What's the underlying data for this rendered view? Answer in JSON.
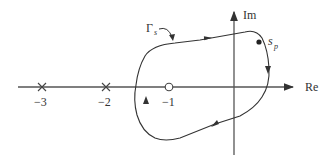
{
  "diagram": {
    "axes": {
      "real_label": "Re",
      "imag_label": "Im"
    },
    "contour_label": "Γ",
    "contour_label_sub": "s",
    "point_label": "s",
    "point_label_sub": "p",
    "poles": [
      {
        "value": "−3",
        "marker": "x"
      },
      {
        "value": "−2",
        "marker": "x"
      }
    ],
    "zeros": [
      {
        "value": "−1",
        "marker": "o"
      }
    ],
    "colors": {
      "stroke": "#333333",
      "axis": "#555555"
    }
  }
}
